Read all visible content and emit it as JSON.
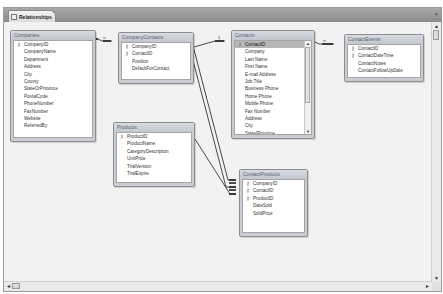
{
  "window": {
    "tab_label": "Relationships",
    "close_glyph": "×"
  },
  "tables": {
    "companies": {
      "title": "Companies",
      "fields": [
        {
          "name": "CompanyID",
          "key": true
        },
        {
          "name": "CompanyName",
          "key": false
        },
        {
          "name": "Department",
          "key": false
        },
        {
          "name": "Address",
          "key": false
        },
        {
          "name": "City",
          "key": false
        },
        {
          "name": "County",
          "key": false
        },
        {
          "name": "StateOrProvince",
          "key": false
        },
        {
          "name": "PostalCode",
          "key": false
        },
        {
          "name": "PhoneNumber",
          "key": false
        },
        {
          "name": "FaxNumber",
          "key": false
        },
        {
          "name": "Website",
          "key": false
        },
        {
          "name": "ReferredBy",
          "key": false
        }
      ]
    },
    "company_contacts": {
      "title": "CompanyContacts",
      "fields": [
        {
          "name": "CompanyID",
          "key": true
        },
        {
          "name": "ContactID",
          "key": true
        },
        {
          "name": "Position",
          "key": false
        },
        {
          "name": "DefaultForContact",
          "key": false
        }
      ]
    },
    "contacts": {
      "title": "Contacts",
      "fields": [
        {
          "name": "ContactID",
          "key": true,
          "selected": true
        },
        {
          "name": "Company",
          "key": false
        },
        {
          "name": "Last Name",
          "key": false
        },
        {
          "name": "First Name",
          "key": false
        },
        {
          "name": "E-mail Address",
          "key": false
        },
        {
          "name": "Job Title",
          "key": false
        },
        {
          "name": "Business Phone",
          "key": false
        },
        {
          "name": "Home Phone",
          "key": false
        },
        {
          "name": "Mobile Phone",
          "key": false
        },
        {
          "name": "Fax Number",
          "key": false
        },
        {
          "name": "Address",
          "key": false
        },
        {
          "name": "City",
          "key": false
        },
        {
          "name": "State/Province",
          "key": false
        }
      ]
    },
    "contact_events": {
      "title": "ContactEvents",
      "fields": [
        {
          "name": "ContactID",
          "key": true
        },
        {
          "name": "ContactDateTime",
          "key": true
        },
        {
          "name": "ContactNotes",
          "key": false
        },
        {
          "name": "ContactFollowUpDate",
          "key": false
        }
      ]
    },
    "products": {
      "title": "Products",
      "fields": [
        {
          "name": "ProductID",
          "key": true
        },
        {
          "name": "ProductName",
          "key": false
        },
        {
          "name": "CategoryDescription",
          "key": false
        },
        {
          "name": "UnitPrice",
          "key": false
        },
        {
          "name": "TrialVersion",
          "key": false
        },
        {
          "name": "TrialExpire",
          "key": false
        }
      ]
    },
    "contact_products": {
      "title": "ContactProducts",
      "fields": [
        {
          "name": "CompanyID",
          "key": true
        },
        {
          "name": "ContactID",
          "key": true
        },
        {
          "name": "ProductID",
          "key": true
        },
        {
          "name": "DateSold",
          "key": false
        },
        {
          "name": "SoldPrice",
          "key": false
        }
      ]
    }
  },
  "relationships": [
    {
      "from": "Companies.CompanyID",
      "to": "CompanyContacts.CompanyID",
      "one": "1",
      "many": "∞"
    },
    {
      "from": "Contacts.ContactID",
      "to": "CompanyContacts.ContactID",
      "one": "1",
      "many": "∞"
    },
    {
      "from": "Contacts.ContactID",
      "to": "ContactEvents.ContactID",
      "one": "1",
      "many": "∞"
    },
    {
      "from": "CompanyContacts.CompanyID",
      "to": "ContactProducts.CompanyID",
      "one": "1",
      "many": "∞"
    },
    {
      "from": "CompanyContacts.ContactID",
      "to": "ContactProducts.ContactID",
      "one": "1",
      "many": "∞"
    },
    {
      "from": "Products.ProductID",
      "to": "ContactProducts.ProductID",
      "one": "1",
      "many": "∞"
    }
  ],
  "icons": {
    "key": "🔑",
    "scroll_up": "▲",
    "scroll_down": "▼",
    "scroll_left": "◄",
    "scroll_right": "►"
  }
}
